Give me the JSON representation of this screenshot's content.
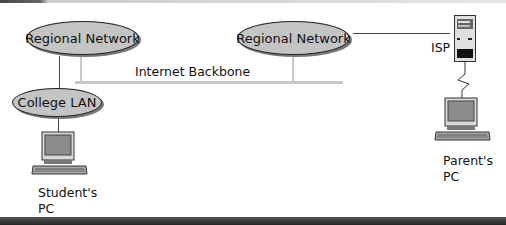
{
  "diagram": {
    "nodes": {
      "regional_left": "Regional Network",
      "regional_right": "Regional Network",
      "college_lan": "College LAN",
      "isp": "ISP",
      "backbone": "Internet Backbone",
      "student_pc_line1": "Student's",
      "student_pc_line2": "PC",
      "parent_pc_line1": "Parent's",
      "parent_pc_line2": "PC"
    },
    "colors": {
      "ellipse_fill": "#c4c4c4",
      "backbone": "#c8c8c8",
      "line": "#444444"
    }
  }
}
